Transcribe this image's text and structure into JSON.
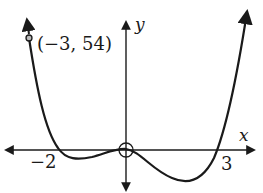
{
  "diagram": {
    "type": "function-graph",
    "curve": "quartic polynomial",
    "axes": {
      "x_label": "x",
      "y_label": "y"
    },
    "x_intercepts": [
      {
        "value": -2,
        "label": "−2"
      },
      {
        "value": 0,
        "label": ""
      },
      {
        "value": 3,
        "label": "3"
      }
    ],
    "marked_point": {
      "x": -3,
      "y": 54,
      "label": "(−3, 54)",
      "style": "open-circle"
    },
    "origin_marker": "open-circle",
    "colors": {
      "curve": "#1a1a1a",
      "axes": "#1a1a1a",
      "background": "#ffffff"
    }
  }
}
